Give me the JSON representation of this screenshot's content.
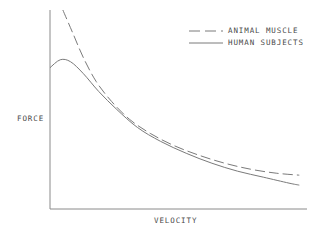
{
  "chart_data": {
    "type": "line",
    "title": "",
    "subtitle": "",
    "xlabel": "VELOCITY",
    "ylabel": "FORCE",
    "xlim": [
      0,
      100
    ],
    "ylim": [
      0,
      100
    ],
    "grid": false,
    "axis_ticks": false,
    "tick_labels": [],
    "legend_position": "top-right",
    "axis_color": "#808080",
    "series": [
      {
        "name": "ANIMAL MUSCLE",
        "style": "dashed",
        "color": "#7a7a7a",
        "dash_pattern": "10 4",
        "x": [
          5,
          9,
          13,
          18,
          24,
          31,
          39,
          48,
          58,
          68,
          78,
          88,
          97
        ],
        "y": [
          100,
          88,
          76,
          64,
          54,
          45,
          38,
          32,
          27,
          23,
          20,
          18,
          17
        ]
      },
      {
        "name": "HUMAN SUBJECTS",
        "style": "solid",
        "color": "#7a7a7a",
        "dash_pattern": "",
        "x": [
          0,
          4,
          8,
          13,
          19,
          26,
          34,
          43,
          53,
          63,
          73,
          83,
          93,
          97
        ],
        "y": [
          71,
          75,
          74,
          68,
          59,
          50,
          41,
          34,
          28,
          23,
          19,
          16,
          13,
          12
        ]
      }
    ]
  },
  "legend": {
    "items": [
      {
        "label": "ANIMAL MUSCLE",
        "style": "dashed"
      },
      {
        "label": "HUMAN SUBJECTS",
        "style": "solid"
      }
    ]
  },
  "axes": {
    "y_title": "FORCE",
    "x_title": "VELOCITY"
  }
}
